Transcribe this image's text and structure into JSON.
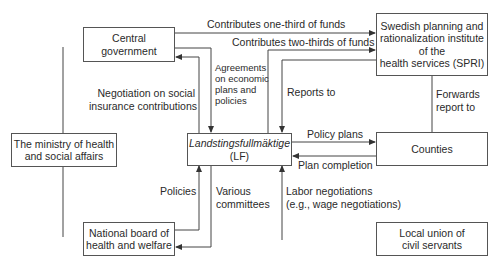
{
  "diagram": {
    "nodes": {
      "central_government": {
        "line1": "Central",
        "line2": "government"
      },
      "spri": {
        "line1": "Swedish planning and",
        "line2": "rationalization institute",
        "line3": "of the",
        "line4": "health services (SPRI)"
      },
      "ministry": {
        "line1": "The ministry of health",
        "line2": "and social affairs"
      },
      "lf": {
        "line1": "Landstingsfullmäktige",
        "line2": "(LF)"
      },
      "counties": {
        "line1": "Counties"
      },
      "national_board": {
        "line1": "National board of",
        "line2": "health and welfare"
      },
      "local_union": {
        "line1": "Local union of",
        "line2": "civil servants"
      }
    },
    "edges": {
      "one_third": "Contributes one-third of funds",
      "two_thirds": "Contributes two-thirds of funds",
      "agreements": {
        "line1": "Agreements",
        "line2": "on economic",
        "line3": "plans and",
        "line4": "policies"
      },
      "negotiation": {
        "line1": "Negotiation on social",
        "line2": "insurance contributions"
      },
      "reports_to": "Reports to",
      "forwards": {
        "line1": "Forwards",
        "line2": "report to"
      },
      "policy_plans": "Policy plans",
      "plan_completion": "Plan completion",
      "policies": "Policies",
      "committees": {
        "line1": "Various",
        "line2": "committees"
      },
      "labor": {
        "line1": "Labor negotiations",
        "line2": "(e.g., wage negotiations)"
      }
    },
    "colors": {
      "line": "#444444",
      "box_border": "#555555",
      "text": "#2a2a2a"
    }
  }
}
